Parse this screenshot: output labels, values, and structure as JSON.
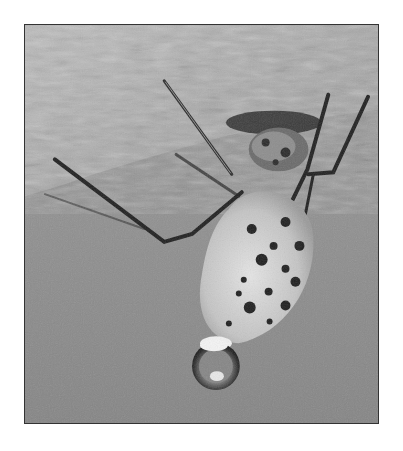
{
  "image": {
    "alt": "Grayscale photograph of a spotted insect hanging upside down from a branch with a water droplet at its tip",
    "subject": "spotted insect",
    "elements": [
      "branch",
      "insect-body",
      "legs",
      "antennae",
      "water-droplet",
      "background"
    ],
    "palette": {
      "background": "#8e8e8e",
      "branch_light": "#c8c8c8",
      "branch_dark": "#6a6a6a",
      "body_light": "#d8d8d8",
      "spots": "#1e1e1e",
      "legs": "#222222",
      "frame_border": "#333333",
      "page": "#ffffff"
    }
  }
}
